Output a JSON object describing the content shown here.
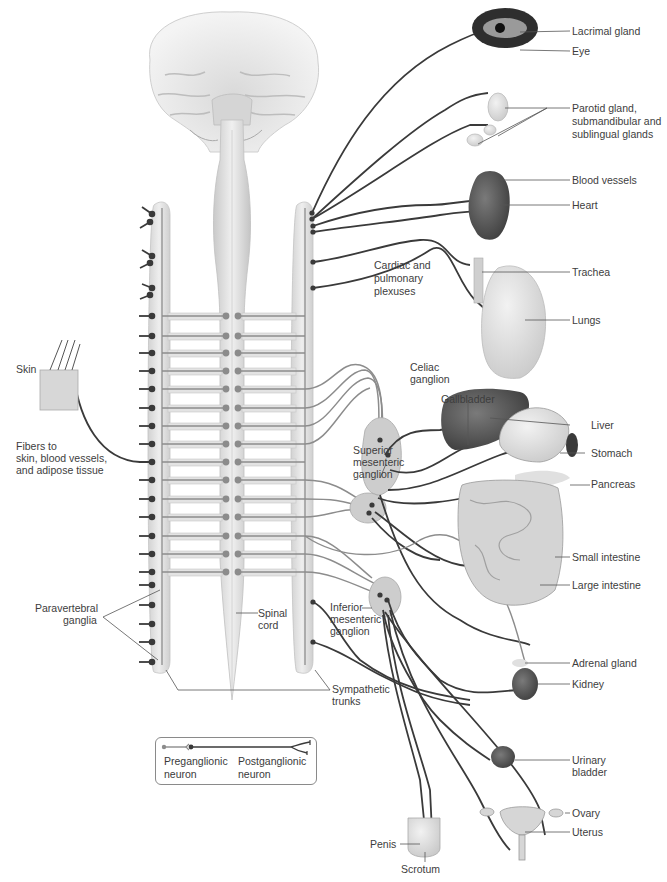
{
  "figure": {
    "type": "sympathetic nervous system anatomy diagram",
    "colors": {
      "preganglionic": "#8c8c8c",
      "postganglionic": "#3a3a3a",
      "trunk": "#dcdcdc",
      "ganglion": "#c8c8c8",
      "label_text": "#3d3d3d",
      "leader_line": "#555555"
    }
  },
  "labels": {
    "lacrimal_gland": "Lacrimal gland",
    "eye": "Eye",
    "salivary": "Parotid gland, submandibular and sublingual glands",
    "salivary_l1": "Parotid gland,",
    "salivary_l2": "submandibular and",
    "salivary_l3": "sublingual glands",
    "blood_vessels": "Blood vessels",
    "heart": "Heart",
    "cardiac_l1": "Cardiac and",
    "cardiac_l2": "pulmonary",
    "cardiac_l3": "plexuses",
    "trachea": "Trachea",
    "lungs": "Lungs",
    "skin": "Skin",
    "fibers_l1": "Fibers to",
    "fibers_l2": "skin, blood vessels,",
    "fibers_l3": "and adipose tissue",
    "celiac_l1": "Celiac",
    "celiac_l2": "ganglion",
    "gallbladder": "Gallbladder",
    "liver": "Liver",
    "stomach": "Stomach",
    "pancreas": "Pancreas",
    "sup_mes_l1": "Superior",
    "sup_mes_l2": "mesenteric",
    "sup_mes_l3": "ganglion",
    "small_intestine": "Small intestine",
    "large_intestine": "Large intestine",
    "paravertebral_l1": "Paravertebral",
    "paravertebral_l2": "ganglia",
    "spinal_l1": "Spinal",
    "spinal_l2": "cord",
    "inf_mes_l1": "Inferior",
    "inf_mes_l2": "mesenteric",
    "inf_mes_l3": "ganglion",
    "adrenal_gland": "Adrenal gland",
    "kidney": "Kidney",
    "sympathetic_l1": "Sympathetic",
    "sympathetic_l2": "trunks",
    "urinary_l1": "Urinary",
    "urinary_l2": "bladder",
    "ovary": "Ovary",
    "uterus": "Uterus",
    "penis": "Penis",
    "scrotum": "Scrotum"
  },
  "legend": {
    "preganglionic_l1": "Preganglionic",
    "preganglionic_l2": "neuron",
    "postganglionic_l1": "Postganglionic",
    "postganglionic_l2": "neuron"
  }
}
